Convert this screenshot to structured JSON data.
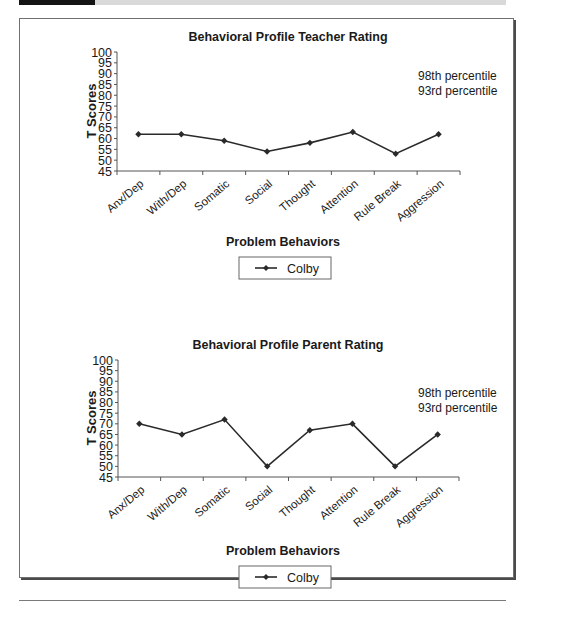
{
  "colors": {
    "line": "#2a2a2a",
    "axis": "#555555",
    "text": "#1a1a1a",
    "frame_border": "#707070",
    "top_bar_light": "#d9d9d9",
    "top_bar_dark": "#141414"
  },
  "chart_data": [
    {
      "type": "line",
      "title": "Behavioral Profile Teacher Rating",
      "xlabel": "Problem Behaviors",
      "ylabel": "T Scores",
      "ylim": [
        45,
        100
      ],
      "yticks": [
        100,
        95,
        90,
        85,
        80,
        75,
        70,
        65,
        60,
        55,
        50,
        45
      ],
      "categories": [
        "Anx/Dep",
        "With/Dep",
        "Somatic",
        "Social",
        "Thought",
        "Attention",
        "Rule Break",
        "Aggression"
      ],
      "series": [
        {
          "name": "Colby",
          "values": [
            62,
            62,
            59,
            54,
            58,
            63,
            53,
            62
          ],
          "marker": "diamond"
        }
      ],
      "annotations": [
        "98th percentile",
        "93rd percentile"
      ],
      "legend": {
        "position": "bottom",
        "entries": [
          "Colby"
        ]
      },
      "grid": false
    },
    {
      "type": "line",
      "title": "Behavioral Profile Parent Rating",
      "xlabel": "Problem Behaviors",
      "ylabel": "T Scores",
      "ylim": [
        45,
        100
      ],
      "yticks": [
        100,
        95,
        90,
        85,
        80,
        75,
        70,
        65,
        60,
        55,
        50,
        45
      ],
      "categories": [
        "Anx/Dep",
        "With/Dep",
        "Somatic",
        "Social",
        "Thought",
        "Attention",
        "Rule Break",
        "Aggression"
      ],
      "series": [
        {
          "name": "Colby",
          "values": [
            70,
            65,
            72,
            50,
            67,
            70,
            50,
            65
          ],
          "marker": "diamond"
        }
      ],
      "annotations": [
        "98th percentile",
        "93rd percentile"
      ],
      "legend": {
        "position": "bottom",
        "entries": [
          "Colby"
        ]
      },
      "grid": false
    }
  ]
}
